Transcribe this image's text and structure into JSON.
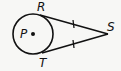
{
  "diagram": {
    "type": "geometry",
    "circle": {
      "center_label": "P",
      "cx": 33,
      "cy": 34,
      "r": 20
    },
    "points": {
      "R": {
        "label": "R",
        "x": 40,
        "y": 15
      },
      "T": {
        "label": "T",
        "x": 42,
        "y": 52
      },
      "S": {
        "label": "S",
        "x": 108,
        "y": 34
      }
    },
    "segments": [
      {
        "from": "S",
        "to": "R",
        "tick_marks": 1
      },
      {
        "from": "S",
        "to": "T",
        "tick_marks": 1
      }
    ],
    "colors": {
      "stroke": "#111111",
      "background": "#f7f7f5"
    }
  }
}
